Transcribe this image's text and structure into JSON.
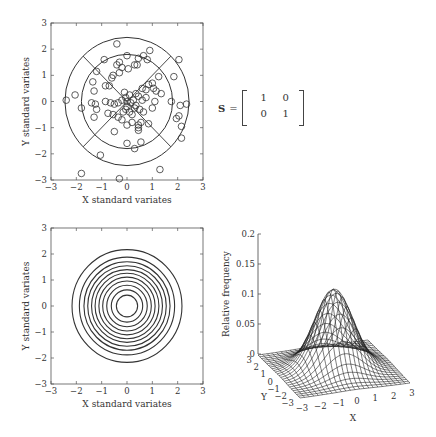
{
  "chart_data": [
    {
      "type": "scatter",
      "name": "scatter-with-circles",
      "xlabel": "X standard variates",
      "ylabel": "Y standard variates",
      "xlim": [
        -3,
        3
      ],
      "ylim": [
        -3,
        3
      ],
      "xticks": [
        "-3",
        "-2",
        "-1",
        "0",
        "1",
        "2",
        "3"
      ],
      "yticks": [
        "3",
        "2",
        "1",
        "0",
        "-1",
        "-2",
        "-3"
      ],
      "circle_radii": [
        1.8,
        2.45
      ],
      "diagonals": true,
      "points": [
        [
          -2.4,
          0.05
        ],
        [
          -2.05,
          0.25
        ],
        [
          -1.8,
          -0.25
        ],
        [
          -1.8,
          -2.75
        ],
        [
          -1.05,
          -2.05
        ],
        [
          -0.3,
          -2.95
        ],
        [
          1.3,
          -2.6
        ],
        [
          -0.4,
          2.2
        ],
        [
          -0.9,
          1.6
        ],
        [
          -0.3,
          1.5
        ],
        [
          -0.4,
          1.4
        ],
        [
          -0.2,
          1.3
        ],
        [
          0.0,
          1.75
        ],
        [
          0.3,
          1.4
        ],
        [
          0.4,
          1.4
        ],
        [
          0.45,
          1.65
        ],
        [
          0.65,
          1.75
        ],
        [
          0.8,
          1.6
        ],
        [
          0.9,
          1.95
        ],
        [
          -1.2,
          1.15
        ],
        [
          -1.35,
          0.75
        ],
        [
          -1.3,
          0.4
        ],
        [
          -0.85,
          0.6
        ],
        [
          -0.7,
          0.6
        ],
        [
          -0.6,
          0.9
        ],
        [
          -0.55,
          1.0
        ],
        [
          -0.3,
          1.1
        ],
        [
          0.05,
          1.25
        ],
        [
          -1.4,
          -0.05
        ],
        [
          -1.25,
          -0.1
        ],
        [
          -1.2,
          -0.3
        ],
        [
          -1.3,
          -0.6
        ],
        [
          -0.85,
          0.0
        ],
        [
          -0.65,
          -0.05
        ],
        [
          -0.5,
          -0.1
        ],
        [
          -0.35,
          -0.05
        ],
        [
          -0.2,
          0.05
        ],
        [
          -0.1,
          0.35
        ],
        [
          0.1,
          0.25
        ],
        [
          0.25,
          0.05
        ],
        [
          0.35,
          0.3
        ],
        [
          0.45,
          0.2
        ],
        [
          0.6,
          0.5
        ],
        [
          0.75,
          0.45
        ],
        [
          0.85,
          0.65
        ],
        [
          1.0,
          0.7
        ],
        [
          1.05,
          0.5
        ],
        [
          1.15,
          0.4
        ],
        [
          1.25,
          0.95
        ],
        [
          0.6,
          0.05
        ],
        [
          0.75,
          0.15
        ],
        [
          1.0,
          -0.25
        ],
        [
          1.1,
          0.0
        ],
        [
          1.35,
          0.3
        ],
        [
          0.35,
          -0.15
        ],
        [
          0.5,
          -0.3
        ],
        [
          0.65,
          -0.4
        ],
        [
          0.85,
          -0.85
        ],
        [
          0.55,
          -0.8
        ],
        [
          0.45,
          -0.9
        ],
        [
          0.45,
          -1.0
        ],
        [
          0.45,
          -1.1
        ],
        [
          0.2,
          -0.8
        ],
        [
          0.0,
          -0.9
        ],
        [
          -0.2,
          -0.7
        ],
        [
          -0.35,
          -0.6
        ],
        [
          -0.55,
          -0.5
        ],
        [
          -0.75,
          -0.45
        ],
        [
          -0.05,
          -0.3
        ],
        [
          0.0,
          -0.2
        ],
        [
          -0.15,
          -0.4
        ],
        [
          0.1,
          -0.4
        ],
        [
          0.2,
          -0.5
        ],
        [
          0.3,
          -0.25
        ],
        [
          0.55,
          -1.55
        ],
        [
          0.0,
          -1.6
        ],
        [
          0.3,
          -1.8
        ],
        [
          -0.5,
          -1.15
        ],
        [
          1.85,
          0.95
        ],
        [
          2.05,
          1.6
        ],
        [
          1.75,
          0.0
        ],
        [
          2.1,
          -0.15
        ],
        [
          2.35,
          -0.1
        ],
        [
          1.95,
          -0.65
        ],
        [
          2.05,
          -0.55
        ],
        [
          2.15,
          -0.95
        ],
        [
          2.15,
          -1.4
        ],
        [
          0.0,
          0.0
        ],
        [
          -0.05,
          0.15
        ],
        [
          0.15,
          -0.05
        ]
      ]
    },
    {
      "type": "contour",
      "name": "concentric-contours",
      "xlabel": "X standard variates",
      "ylabel": "Y standard variates",
      "xlim": [
        -3,
        3
      ],
      "ylim": [
        -3,
        3
      ],
      "xticks": [
        "-3",
        "-2",
        "-1",
        "0",
        "1",
        "2",
        "3"
      ],
      "yticks": [
        "3",
        "2",
        "1",
        "0",
        "-1",
        "-2",
        "-3"
      ],
      "contour_radii": [
        0.42,
        0.62,
        0.8,
        0.96,
        1.11,
        1.26,
        1.4,
        1.55,
        1.7,
        1.88,
        2.17
      ]
    },
    {
      "type": "surface",
      "name": "bivariate-normal-surface",
      "zlabel": "Relative frequency",
      "xlabel": "X",
      "ylabel": "Y",
      "zticks": [
        "0",
        "0.05",
        "0.1",
        "0.15",
        "0.2"
      ],
      "xticks": [
        "-3",
        "-2",
        "-1",
        "0",
        "1",
        "2",
        "3"
      ],
      "yticks": [
        "3",
        "2",
        "1",
        "0",
        "-1",
        "-2",
        "-3"
      ],
      "zlim": [
        0,
        0.2
      ],
      "peak": 0.133,
      "description": "Standard bivariate normal density, covariance identity"
    }
  ],
  "matrix": {
    "symbol": "S",
    "equals": "=",
    "rows": [
      [
        "1",
        "0"
      ],
      [
        "0",
        "1"
      ]
    ]
  },
  "labels": {
    "x_std": "X standard variates",
    "y_std": "Y standard variates",
    "rel_freq": "Relative frequency",
    "x": "X",
    "y": "Y"
  }
}
